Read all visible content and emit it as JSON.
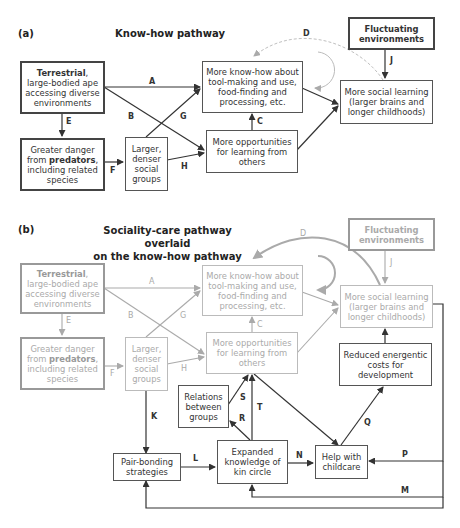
{
  "panel_a": {
    "label": "(a)",
    "title": "Know-how pathway",
    "nodes": {
      "terrestrial": {
        "bold": "Terrestrial",
        "rest": ", large-bodied ape accessing diverse environments"
      },
      "predators": {
        "pre": "Greater danger from ",
        "bold": "predators",
        "post": ", including related species"
      },
      "social_groups": {
        "text": "Larger, denser social groups"
      },
      "know_how": {
        "text": "More know-how about tool-making and use, food-finding and processing, etc."
      },
      "opportunities": {
        "text": "More opportunities for learning from others"
      },
      "social_learning": {
        "text": "More social learning (larger brains and longer childhoods)"
      },
      "fluctuating": {
        "text": "Fluctuating environments"
      }
    },
    "edges": {
      "A": "A",
      "B": "B",
      "C": "C",
      "D": "D",
      "E": "E",
      "F": "F",
      "G": "G",
      "H": "H",
      "J": "J"
    }
  },
  "panel_b": {
    "label": "(b)",
    "title_line1": "Sociality-care pathway overlaid",
    "title_line2": "on the know-how pathway",
    "nodes": {
      "terrestrial": {
        "bold": "Terrestrial",
        "rest": ", large-bodied ape accessing diverse environments"
      },
      "predators": {
        "pre": "Greater danger from ",
        "bold": "predators",
        "post": ", including related species"
      },
      "social_groups": {
        "text": "Larger, denser social groups"
      },
      "know_how": {
        "text": "More know-how about tool-making and use, food-finding and processing, etc."
      },
      "opportunities": {
        "text": "More opportunities for learning from others"
      },
      "social_learning": {
        "text": "More social learning (larger brains and longer childhoods)"
      },
      "fluctuating": {
        "text": "Fluctuating environments"
      },
      "reduced_costs": {
        "text": "Reduced energentic costs for development"
      },
      "relations": {
        "text": "Relations between groups"
      },
      "pair_bonding": {
        "text": "Pair-bonding strategies"
      },
      "kin_circle": {
        "text": "Expanded knowledge of kin circle"
      },
      "childcare": {
        "text": "Help with childcare"
      }
    },
    "edges": {
      "A": "A",
      "B": "B",
      "C": "C",
      "D": "D",
      "E": "E",
      "F": "F",
      "G": "G",
      "H": "H",
      "J": "J",
      "K": "K",
      "L": "L",
      "M": "M",
      "N": "N",
      "P": "P",
      "Q": "Q",
      "R": "R",
      "S": "S",
      "T": "T"
    }
  },
  "colors": {
    "active": "#333333",
    "faded": "#b0b0b0",
    "dashed_arc": "#c0c0c0"
  }
}
